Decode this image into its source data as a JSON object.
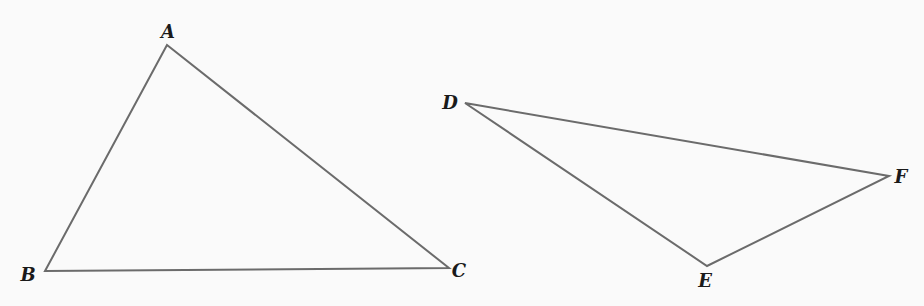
{
  "diagram": {
    "type": "geometry",
    "stroke_color": "#6b6b6b",
    "background": "#fafafa",
    "triangles": [
      {
        "name": "ABC",
        "vertices": [
          {
            "label": "A",
            "x": 167,
            "y": 45,
            "lx": 168,
            "ly": 38
          },
          {
            "label": "B",
            "x": 45,
            "y": 271,
            "lx": 28,
            "ly": 281
          },
          {
            "label": "C",
            "x": 449,
            "y": 268,
            "lx": 459,
            "ly": 277
          }
        ]
      },
      {
        "name": "DEF",
        "vertices": [
          {
            "label": "D",
            "x": 465,
            "y": 103,
            "lx": 450,
            "ly": 109
          },
          {
            "label": "E",
            "x": 707,
            "y": 266,
            "lx": 705,
            "ly": 287
          },
          {
            "label": "F",
            "x": 889,
            "y": 176,
            "lx": 901,
            "ly": 183
          }
        ]
      }
    ]
  }
}
